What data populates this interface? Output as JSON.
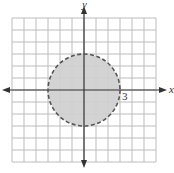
{
  "figure": {
    "x_axis_label": "x",
    "y_axis_label": "y",
    "tick_label": "3",
    "grid": {
      "x_min": -6,
      "x_max": 6,
      "y_min": -6,
      "y_max": 6
    },
    "circle": {
      "center": [
        0,
        0
      ],
      "radius": 3,
      "boundary": "dashed",
      "fill": "#d3d3d3",
      "region": "interior"
    },
    "colors": {
      "grid": "#b8b8b8",
      "axes": "#333333",
      "circle_stroke": "#555555",
      "fill": "#d3d3d3"
    }
  }
}
